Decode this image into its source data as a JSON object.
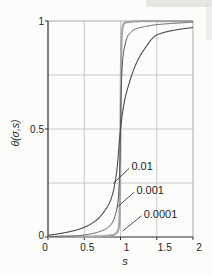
{
  "figure": {
    "background": "#fcfcfa",
    "axis_color": "#2e2e2e",
    "frame_color": "#a8a8a8",
    "grid_color": "#bdbdbd",
    "text_color": "#1e1e1e",
    "annotation_line_color": "#3a3a3a"
  },
  "chart_data": {
    "type": "line",
    "title": "",
    "xlabel": "s",
    "ylabel": "θ(σ,s)",
    "xlim": [
      0,
      2
    ],
    "ylim": [
      0,
      1
    ],
    "xticks": [
      0,
      0.5,
      1,
      1.5,
      2
    ],
    "xtick_labels": [
      "0",
      "0.5",
      "1",
      "1.5",
      "2"
    ],
    "yticks": [
      0,
      0.5,
      1
    ],
    "ytick_labels": [
      "0",
      "0.5",
      "1"
    ],
    "grid": true,
    "grid_x": [
      0.5,
      1,
      1.5
    ],
    "grid_y": [
      0.25,
      0.5,
      0.75
    ],
    "legend_position": "inline-annotations",
    "series": [
      {
        "name": "sigma = 0.01",
        "label": "0.01",
        "color": "#4d4d4d",
        "stroke_width": 1.1,
        "x": [
          0,
          0.2,
          0.4,
          0.5,
          0.6,
          0.7,
          0.8,
          0.85,
          0.9,
          0.95,
          1.0,
          1.05,
          1.1,
          1.2,
          1.3,
          1.5,
          1.75,
          2.0
        ],
        "y": [
          0.008,
          0.018,
          0.033,
          0.045,
          0.062,
          0.088,
          0.13,
          0.16,
          0.21,
          0.31,
          0.5,
          0.62,
          0.69,
          0.79,
          0.855,
          0.935,
          0.958,
          0.97
        ]
      },
      {
        "name": "sigma = 0.001",
        "label": "0.001",
        "color": "#585858",
        "stroke_width": 1.0,
        "x": [
          0,
          0.4,
          0.6,
          0.75,
          0.85,
          0.9,
          0.95,
          0.97,
          0.99,
          1.0,
          1.01,
          1.03,
          1.05,
          1.1,
          1.2,
          1.35,
          1.5,
          2.0
        ],
        "y": [
          0.002,
          0.006,
          0.015,
          0.03,
          0.05,
          0.075,
          0.13,
          0.18,
          0.32,
          0.5,
          0.68,
          0.82,
          0.87,
          0.93,
          0.962,
          0.975,
          0.983,
          0.995
        ]
      },
      {
        "name": "sigma = 0.0001",
        "label": "0.0001",
        "color": "#a6a6a6",
        "stroke_width": 2.2,
        "x": [
          0,
          0.6,
          0.8,
          0.9,
          0.95,
          0.97,
          0.98,
          0.99,
          0.995,
          1.0,
          1.005,
          1.01,
          1.02,
          1.03,
          1.05,
          1.1,
          1.3,
          2.0
        ],
        "y": [
          0.0,
          0.002,
          0.005,
          0.01,
          0.02,
          0.035,
          0.05,
          0.12,
          0.28,
          0.5,
          0.72,
          0.88,
          0.95,
          0.975,
          0.99,
          0.995,
          0.999,
          1.0
        ]
      }
    ],
    "annotations": [
      {
        "text": "0.01",
        "x": 1.15,
        "y": 0.325,
        "leader": [
          [
            1.12,
            0.318
          ],
          [
            0.9,
            0.248
          ]
        ]
      },
      {
        "text": "0.001",
        "x": 1.22,
        "y": 0.215,
        "leader": [
          [
            1.19,
            0.208
          ],
          [
            0.955,
            0.138
          ]
        ]
      },
      {
        "text": "0.0001",
        "x": 1.32,
        "y": 0.105,
        "leader": [
          [
            1.29,
            0.098
          ],
          [
            1.03,
            0.028
          ]
        ]
      }
    ],
    "layout_hints": {
      "xtick_label_dx": [
        -3,
        3,
        6,
        8,
        6
      ],
      "tick_length": 3,
      "tick_font_size": 10,
      "annotation_font_size": 11
    }
  }
}
